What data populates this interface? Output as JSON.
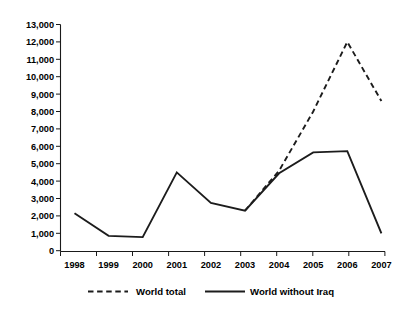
{
  "chart_data": {
    "type": "line",
    "title": "",
    "xlabel": "",
    "ylabel": "",
    "categories": [
      "1998",
      "1999",
      "2000",
      "2001",
      "2002",
      "2003",
      "2004",
      "2005",
      "2006",
      "2007"
    ],
    "ylim": [
      0,
      13000
    ],
    "ytick_labels": [
      "0",
      "1,000",
      "2,000",
      "3,000",
      "4,000",
      "5,000",
      "6,000",
      "7,000",
      "8,000",
      "9,000",
      "10,000",
      "11,000",
      "12,000",
      "13,000"
    ],
    "ytick_values": [
      0,
      1000,
      2000,
      3000,
      4000,
      5000,
      6000,
      7000,
      8000,
      9000,
      10000,
      11000,
      12000,
      13000
    ],
    "ytick_step": 1000,
    "grid": false,
    "legend_position": "bottom",
    "series": [
      {
        "name": "World total",
        "style": "dashed",
        "color": "#1c1c1c",
        "x": [
          "2003",
          "2004",
          "2005",
          "2006",
          "2007"
        ],
        "values": [
          2300,
          4600,
          8000,
          12000,
          8600
        ]
      },
      {
        "name": "World without Iraq",
        "style": "solid",
        "color": "#1c1c1c",
        "x": [
          "1998",
          "1999",
          "2000",
          "2001",
          "2002",
          "2003",
          "2004",
          "2005",
          "2006",
          "2007"
        ],
        "values": [
          2150,
          850,
          780,
          4500,
          2750,
          2300,
          4450,
          5650,
          5720,
          1000
        ]
      }
    ]
  },
  "legend": {
    "items": [
      {
        "label": "World total",
        "style": "dashed"
      },
      {
        "label": "World without Iraq",
        "style": "solid"
      }
    ]
  },
  "axes": {
    "x_tick_labels": [
      "1998",
      "1999",
      "2000",
      "2001",
      "2002",
      "2003",
      "2004",
      "2005",
      "2006",
      "2007"
    ],
    "y_tick_labels": [
      "13,000",
      "12,000",
      "11,000",
      "10,000",
      "9,000",
      "8,000",
      "7,000",
      "6,000",
      "5,000",
      "4,000",
      "3,000",
      "2,000",
      "1,000",
      "0"
    ]
  }
}
